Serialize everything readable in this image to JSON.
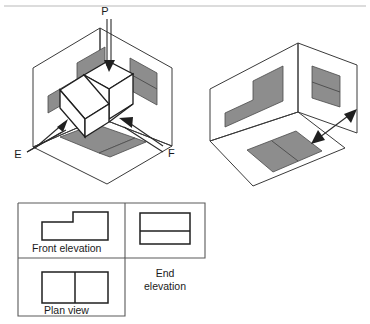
{
  "figure": {
    "colors": {
      "shade_fill": "#8d8d8d",
      "outline": "#1f1f1f",
      "plane_stroke": "#3a3a3a",
      "panel_border": "#5a5a5a",
      "background": "#ffffff",
      "top_rule": "#b9b9b9"
    }
  },
  "left_diagram": {
    "name": "projection-box-with-object",
    "labels": {
      "p": "P",
      "e": "E",
      "f": "F"
    },
    "arrows": [
      {
        "name": "arrow-p",
        "label": "P",
        "direction": "down"
      },
      {
        "name": "arrow-e",
        "label": "E",
        "direction": "up-right"
      },
      {
        "name": "arrow-f",
        "label": "F",
        "direction": "up-left"
      }
    ],
    "shaded_projections": [
      "front-elevation-shadow",
      "end-elevation-shadow",
      "plan-view-shadow"
    ]
  },
  "right_diagram": {
    "name": "projection-box-unfolding",
    "shaded_projections": [
      "front-elevation-shadow",
      "end-elevation-shadow",
      "plan-view-shadow"
    ],
    "arrows": [
      {
        "name": "unfold-arrow",
        "direction": "double"
      }
    ]
  },
  "ortho_panel": {
    "name": "orthographic-views-panel",
    "views": [
      {
        "id": "front-elevation",
        "label": "Front elevation",
        "shape": "stepped-L-profile"
      },
      {
        "id": "end-elevation",
        "label_line1": "End",
        "label_line2": "elevation",
        "shape": "rectangle-with-horizontal-divider"
      },
      {
        "id": "plan-view",
        "label": "Plan view",
        "shape": "rectangle-with-vertical-divider"
      }
    ]
  }
}
